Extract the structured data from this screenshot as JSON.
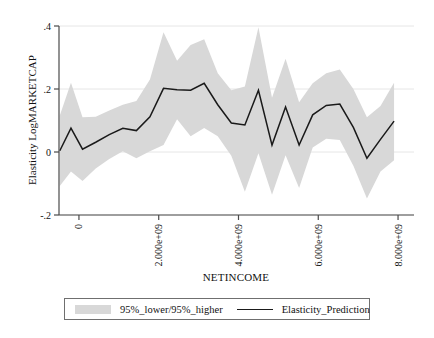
{
  "chart_data": {
    "type": "line",
    "title": "",
    "xlabel": "NETINCOME",
    "ylabel": "Elasticity LogMARKETCAP",
    "xlim": [
      -500000000,
      8400000000
    ],
    "ylim": [
      -0.2,
      0.4
    ],
    "grid": true,
    "grid_axis": "y",
    "legend_position": "bottom",
    "xtick_labels": [
      "0",
      "2.000e+09",
      "4.000e+09",
      "6.000e+09",
      "8.000e+09"
    ],
    "xtick_values": [
      0,
      2000000000,
      4000000000,
      6000000000,
      8000000000
    ],
    "ytick_labels": [
      "-.2",
      "0",
      ".2",
      ".4"
    ],
    "ytick_values": [
      -0.2,
      0,
      0.2,
      0.4
    ],
    "x": [
      -480000000,
      -200000000,
      90000000,
      420000000,
      760000000,
      1100000000,
      1440000000,
      1780000000,
      2120000000,
      2460000000,
      2800000000,
      3140000000,
      3480000000,
      3820000000,
      4160000000,
      4500000000,
      4840000000,
      5180000000,
      5520000000,
      5860000000,
      6200000000,
      6540000000,
      6880000000,
      7220000000,
      7560000000,
      7900000000
    ],
    "series": [
      {
        "name": "Elasticity_Prediction",
        "color": "#1a1a1a",
        "style": "line",
        "values": [
          0.004,
          0.076,
          0.009,
          0.031,
          0.055,
          0.075,
          0.068,
          0.112,
          0.202,
          0.198,
          0.196,
          0.218,
          0.15,
          0.092,
          0.086,
          0.196,
          0.022,
          0.143,
          0.022,
          0.118,
          0.148,
          0.152,
          0.078,
          -0.02,
          0.04,
          0.098
        ]
      },
      {
        "name": "95%_higher",
        "color": "#d8d8d8",
        "style": "band-upper",
        "values": [
          0.116,
          0.22,
          0.11,
          0.112,
          0.132,
          0.15,
          0.162,
          0.23,
          0.38,
          0.29,
          0.34,
          0.358,
          0.25,
          0.196,
          0.208,
          0.396,
          0.172,
          0.296,
          0.158,
          0.218,
          0.25,
          0.262,
          0.2,
          0.11,
          0.146,
          0.22
        ]
      },
      {
        "name": "95%_lower",
        "color": "#d8d8d8",
        "style": "band-lower",
        "values": [
          -0.108,
          -0.062,
          -0.092,
          -0.052,
          -0.022,
          0.002,
          -0.02,
          0.002,
          0.022,
          0.104,
          0.05,
          0.076,
          0.05,
          -0.012,
          -0.126,
          -0.004,
          -0.136,
          -0.01,
          -0.114,
          0.014,
          0.042,
          0.038,
          -0.044,
          -0.148,
          -0.062,
          -0.026
        ]
      }
    ]
  },
  "legend": {
    "entries": [
      {
        "label": "95%_lower/95%_higher",
        "marker": "band",
        "color": "#d8d8d8"
      },
      {
        "label": "Elasticity_Prediction",
        "marker": "line",
        "color": "#1a1a1a"
      }
    ]
  }
}
